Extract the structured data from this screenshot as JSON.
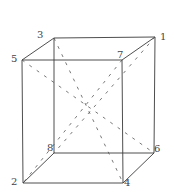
{
  "diagram": {
    "title": "",
    "type": "cube-wireframe",
    "vertices": [
      {
        "id": "1",
        "x": 155,
        "y": 37,
        "label": "1",
        "lx": 160,
        "ly": 40
      },
      {
        "id": "2",
        "x": 23,
        "y": 183,
        "label": "2",
        "lx": 11,
        "ly": 185
      },
      {
        "id": "3",
        "x": 54,
        "y": 38,
        "label": "3",
        "lx": 37,
        "ly": 38
      },
      {
        "id": "4",
        "x": 123,
        "y": 183,
        "label": "4",
        "lx": 124,
        "ly": 186
      },
      {
        "id": "5",
        "x": 22,
        "y": 60,
        "label": "5",
        "lx": 11,
        "ly": 62
      },
      {
        "id": "6",
        "x": 154,
        "y": 153,
        "label": "6",
        "lx": 154,
        "ly": 152
      },
      {
        "id": "7",
        "x": 122,
        "y": 60,
        "label": "7",
        "lx": 117,
        "ly": 58
      },
      {
        "id": "8",
        "x": 54,
        "y": 153,
        "label": "8",
        "lx": 47,
        "ly": 151
      }
    ],
    "edges": [
      [
        "3",
        "1"
      ],
      [
        "5",
        "7"
      ],
      [
        "3",
        "5"
      ],
      [
        "1",
        "7"
      ],
      [
        "5",
        "2"
      ],
      [
        "7",
        "4"
      ],
      [
        "3",
        "8"
      ],
      [
        "1",
        "6"
      ],
      [
        "2",
        "4"
      ],
      [
        "8",
        "6"
      ],
      [
        "8",
        "2"
      ],
      [
        "6",
        "4"
      ]
    ],
    "diagonals_dashed": [
      [
        "5",
        "6"
      ],
      [
        "3",
        "4"
      ],
      [
        "1",
        "8"
      ],
      [
        "7",
        "2"
      ]
    ],
    "colors": {
      "edge": "#3a3a3a",
      "dashed": "#555555",
      "label": "#444444"
    }
  }
}
